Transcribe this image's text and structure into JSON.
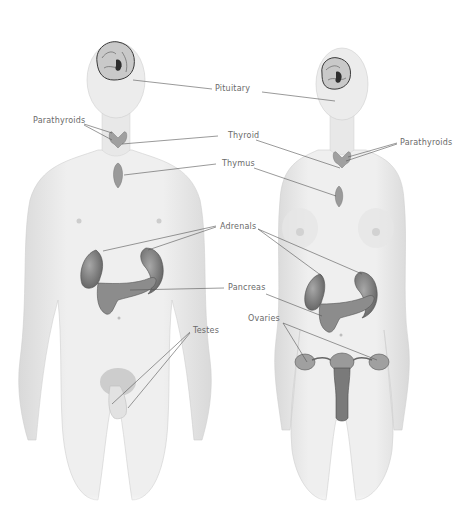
{
  "diagram": {
    "figures": [
      {
        "id": "male",
        "name": "Male figure"
      },
      {
        "id": "female",
        "name": "Female figure"
      }
    ],
    "labels": {
      "pituitary": "Pituitary",
      "parathyroids_left": "Parathyroids",
      "parathyroids_right": "Parathyroids",
      "thyroid": "Thyroid",
      "thymus": "Thymus",
      "adrenals": "Adrenals",
      "pancreas": "Pancreas",
      "testes": "Testes",
      "ovaries": "Ovaries"
    },
    "colors": {
      "background": "#ffffff",
      "skin": "#ececec",
      "skin_shade": "#d6d6d6",
      "organ": "#8c8c8c",
      "organ_dark": "#5e5e5e",
      "leader_line": "#555555",
      "label_text": "#6a6a6a"
    }
  }
}
